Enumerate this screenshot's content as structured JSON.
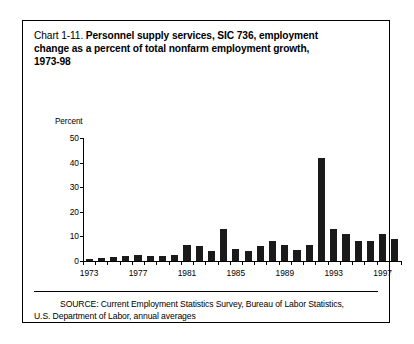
{
  "title": {
    "prefix": "Chart 1-11.",
    "lines": [
      "Personnel supply services, SIC 736, employment",
      "change as a percent of total nonfarm employment growth,",
      "1973-98"
    ]
  },
  "axis_unit_label": "Percent",
  "source": {
    "line1": "SOURCE: Current Employment Statistics Survey, Bureau of Labor Statistics,",
    "line2": "U.S. Department of Labor, annual averages"
  },
  "colors": {
    "bar": "#1a1a1a",
    "axis": "#000000",
    "border": "#000000",
    "background": "#ffffff"
  },
  "chart_data": {
    "type": "bar",
    "title": "Chart 1-11. Personnel supply services, SIC 736, employment change as a percent of total nonfarm employment growth, 1973-98",
    "xlabel": "",
    "ylabel": "Percent",
    "ylim": [
      0,
      50
    ],
    "yticks": [
      0,
      10,
      20,
      30,
      40,
      50
    ],
    "xtick_labels": [
      "1973",
      "1977",
      "1981",
      "1985",
      "1989",
      "1993",
      "1997"
    ],
    "grid": false,
    "legend": null,
    "categories": [
      "1973",
      "1974",
      "1975",
      "1976",
      "1977",
      "1978",
      "1979",
      "1980",
      "1981",
      "1982",
      "1983",
      "1984",
      "1985",
      "1986",
      "1987",
      "1988",
      "1989",
      "1990",
      "1991",
      "1992",
      "1993",
      "1994",
      "1995",
      "1996",
      "1997",
      "1998"
    ],
    "values": [
      1.0,
      1.2,
      1.5,
      2.0,
      2.5,
      2.2,
      2.0,
      2.5,
      6.5,
      6.0,
      4.0,
      13.0,
      5.0,
      4.0,
      6.0,
      8.0,
      6.5,
      4.5,
      6.5,
      42.0,
      13.0,
      11.0,
      8.0,
      8.0,
      11.0,
      9.0
    ]
  }
}
